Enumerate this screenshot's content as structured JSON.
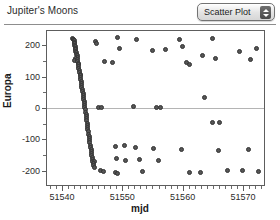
{
  "header": {
    "title": "Jupiter's Moons",
    "popup": {
      "label": "Scatter Plot",
      "up_arrow": "stepper-up-arrow",
      "down_arrow": "stepper-down-arrow"
    }
  },
  "chart_data": {
    "type": "scatter",
    "title": "Jupiter's Moons",
    "xlabel": "mjd",
    "ylabel": "Europa",
    "xlim": [
      51537.5,
      51573.5
    ],
    "ylim": [
      -245,
      245
    ],
    "grid": false,
    "zero_line": true,
    "legend": "none",
    "xticks": [
      51540,
      51550,
      51560,
      51570
    ],
    "xtick_labels": [
      "51540",
      "51550",
      "51560",
      "51570"
    ],
    "xminor_step": 1,
    "yticks": [
      200,
      100,
      0,
      -100,
      -200
    ],
    "ytick_labels": [
      "200",
      "100",
      "0",
      "-100",
      "-200"
    ],
    "yminor": [
      150,
      50,
      -50,
      -150
    ],
    "marker": "filled-circle",
    "marker_color": "#555555",
    "marker_edge_color": "#333333",
    "series": [
      {
        "name": "Europa",
        "points": [
          [
            51541.8,
            222
          ],
          [
            51541.9,
            218
          ],
          [
            51542.0,
            215
          ],
          [
            51542.0,
            209
          ],
          [
            51542.1,
            205
          ],
          [
            51542.1,
            199
          ],
          [
            51542.2,
            196
          ],
          [
            51542.2,
            190
          ],
          [
            51542.3,
            186
          ],
          [
            51542.3,
            180
          ],
          [
            51542.4,
            176
          ],
          [
            51542.4,
            170
          ],
          [
            51542.5,
            166
          ],
          [
            51542.5,
            160
          ],
          [
            51542.2,
            158
          ],
          [
            51542.1,
            150
          ],
          [
            51542.6,
            154
          ],
          [
            51542.6,
            148
          ],
          [
            51542.7,
            143
          ],
          [
            51542.7,
            137
          ],
          [
            51542.8,
            132
          ],
          [
            51542.8,
            126
          ],
          [
            51542.9,
            120
          ],
          [
            51542.9,
            114
          ],
          [
            51543.0,
            108
          ],
          [
            51543.0,
            102
          ],
          [
            51543.1,
            96
          ],
          [
            51543.1,
            90
          ],
          [
            51543.2,
            84
          ],
          [
            51543.2,
            78
          ],
          [
            51543.3,
            72
          ],
          [
            51543.3,
            66
          ],
          [
            51543.4,
            60
          ],
          [
            51543.4,
            54
          ],
          [
            51543.5,
            47
          ],
          [
            51543.5,
            41
          ],
          [
            51543.6,
            34
          ],
          [
            51543.6,
            28
          ],
          [
            51543.7,
            21
          ],
          [
            51543.7,
            14
          ],
          [
            51543.8,
            8
          ],
          [
            51543.8,
            1
          ],
          [
            51543.9,
            -6
          ],
          [
            51543.9,
            -13
          ],
          [
            51544.0,
            -20
          ],
          [
            51544.0,
            -27
          ],
          [
            51544.1,
            -34
          ],
          [
            51544.1,
            -41
          ],
          [
            51544.2,
            -48
          ],
          [
            51544.2,
            -55
          ],
          [
            51544.3,
            -62
          ],
          [
            51544.3,
            -69
          ],
          [
            51544.4,
            -76
          ],
          [
            51544.4,
            -83
          ],
          [
            51544.5,
            -90
          ],
          [
            51544.5,
            -97
          ],
          [
            51544.6,
            -104
          ],
          [
            51544.6,
            -111
          ],
          [
            51544.7,
            -118
          ],
          [
            51544.7,
            -125
          ],
          [
            51544.8,
            -132
          ],
          [
            51544.8,
            -139
          ],
          [
            51544.9,
            -146
          ],
          [
            51544.9,
            -152
          ],
          [
            51545.0,
            -158
          ],
          [
            51545.0,
            -164
          ],
          [
            51545.1,
            -170
          ],
          [
            51545.3,
            -171
          ],
          [
            51545.2,
            -176
          ],
          [
            51545.2,
            -182
          ],
          [
            51545.4,
            -188
          ],
          [
            51545.6,
            212
          ],
          [
            51545.7,
            205
          ],
          [
            51546.0,
            3
          ],
          [
            51546.6,
            1
          ],
          [
            51546.4,
            -200
          ],
          [
            51546.9,
            -203
          ],
          [
            51547.1,
            148
          ],
          [
            51548.4,
            146
          ],
          [
            51549.2,
            225
          ],
          [
            51549.6,
            188
          ],
          [
            51548.8,
            -123
          ],
          [
            51550.3,
            -120
          ],
          [
            51549.0,
            -160
          ],
          [
            51550.6,
            -168
          ],
          [
            51548.9,
            -206
          ],
          [
            51549.2,
            -208
          ],
          [
            51552.4,
            218
          ],
          [
            51551.9,
            4
          ],
          [
            51552.1,
            -126
          ],
          [
            51552.8,
            -163
          ],
          [
            51553.3,
            -201
          ],
          [
            51555.0,
            183
          ],
          [
            51557.1,
            186
          ],
          [
            51555.6,
            3
          ],
          [
            51556.3,
            1
          ],
          [
            51555.2,
            -128
          ],
          [
            51556.0,
            -166
          ],
          [
            51559.4,
            219
          ],
          [
            51560.0,
            196
          ],
          [
            51560.6,
            146
          ],
          [
            51561.1,
            139
          ],
          [
            51559.8,
            -131
          ],
          [
            51561.2,
            -205
          ],
          [
            51563.3,
            168
          ],
          [
            51563.7,
            35
          ],
          [
            51562.9,
            -206
          ],
          [
            51565.0,
            221
          ],
          [
            51565.4,
            156
          ],
          [
            51564.9,
            -46
          ],
          [
            51566.2,
            -45
          ],
          [
            51566.0,
            -134
          ],
          [
            51567.4,
            -200
          ],
          [
            51569.5,
            181
          ],
          [
            51569.9,
            -198
          ],
          [
            51571.3,
            154
          ],
          [
            51571.0,
            -131
          ],
          [
            51572.6,
            -201
          ],
          [
            51572.2,
            188
          ]
        ]
      }
    ]
  }
}
